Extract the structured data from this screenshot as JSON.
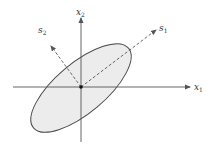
{
  "diagram": {
    "type": "ellipse-with-principal-axes",
    "axes": {
      "x1": {
        "label": "x",
        "subscript": "1"
      },
      "x2": {
        "label": "x",
        "subscript": "2"
      }
    },
    "principal_axes": {
      "s1": {
        "label": "s",
        "subscript": "1"
      },
      "s2": {
        "label": "s",
        "subscript": "2"
      }
    },
    "colors": {
      "line": "#4a4a4a",
      "ellipse_fill": "#ececec",
      "dashed": "#555555"
    }
  }
}
